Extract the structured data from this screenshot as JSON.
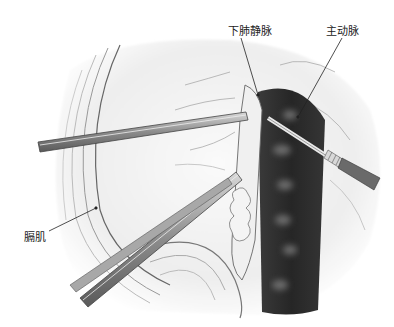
{
  "figure": {
    "type": "surgical illustration",
    "labels": {
      "inferior_pulmonary_vein": "下肺静脉",
      "aorta": "主动脉",
      "diaphragm": "膈肌"
    },
    "colors": {
      "aorta_fill": "#2e2e2e",
      "tissue_line": "#555555",
      "instrument_fill": "#9a9a9a",
      "label_text": "#222222"
    }
  }
}
